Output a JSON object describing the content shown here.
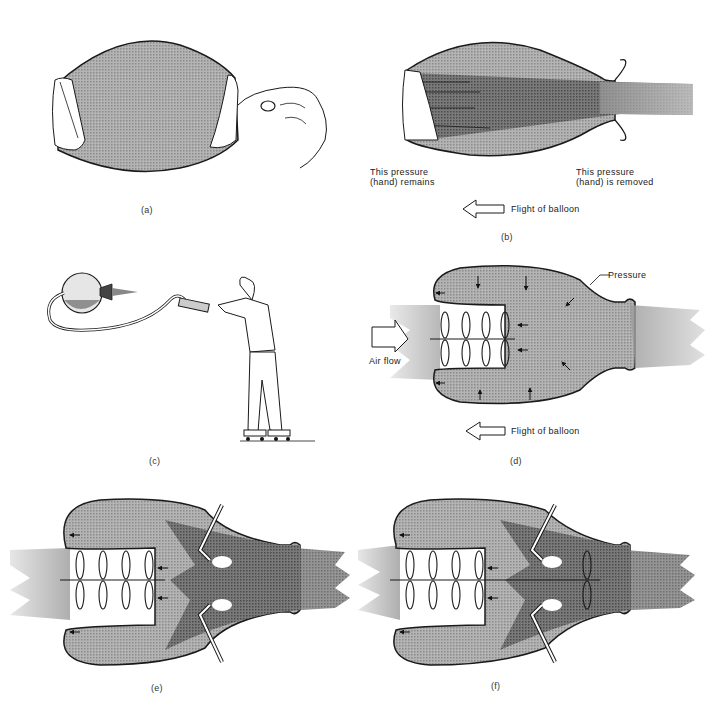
{
  "figure": {
    "panels": [
      {
        "id": "a",
        "caption": "(a)",
        "description": "Inflated balloon held closed by hands at both ends"
      },
      {
        "id": "b",
        "caption": "(b)",
        "labels": {
          "left_pressure": [
            "This pressure",
            "(hand) remains"
          ],
          "right_pressure": [
            "This pressure",
            "(hand) is removed"
          ],
          "flight": "Flight of balloon"
        }
      },
      {
        "id": "c",
        "caption": "(c)",
        "description": "Man on roller skates holding hose connected to balloon"
      },
      {
        "id": "d",
        "caption": "(d)",
        "labels": {
          "pressure": "Pressure",
          "air_flow": "Air flow",
          "flight": "Flight of balloon"
        }
      },
      {
        "id": "e",
        "caption": "(e)",
        "description": "Balloon with compressor fans and fuel nozzles (combustion)"
      },
      {
        "id": "f",
        "caption": "(f)",
        "description": "Balloon with compressor, combustion and turbine"
      }
    ]
  },
  "colors": {
    "fill_light": "#a9a9a9",
    "fill_dark": "#6b6b6b",
    "stroke": "#1a1a1a",
    "jet": "#8c8c8c"
  }
}
